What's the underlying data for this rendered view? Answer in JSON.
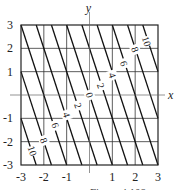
{
  "chart_data": {
    "type": "contour",
    "title": "",
    "xlabel": "x",
    "ylabel": "y",
    "xlim": [
      -3,
      3
    ],
    "ylim": [
      -3,
      3
    ],
    "grid": true,
    "xticks": [
      -3,
      -2,
      -1,
      1,
      2,
      3
    ],
    "yticks": [
      3,
      2,
      1,
      -1,
      -2,
      -3
    ],
    "xtick_labels": [
      "-3",
      "-2",
      "-1",
      "1",
      "2",
      "3"
    ],
    "ytick_labels": [
      "3",
      "2",
      "1",
      "-1",
      "-2",
      "-3"
    ],
    "function": "f(x,y) = |3x + y|",
    "contour_levels": [
      -12,
      -10,
      -8,
      -6,
      -4,
      -2,
      0,
      2,
      4,
      6,
      8,
      10,
      12
    ],
    "contour_labels": [
      {
        "text": "10",
        "x": 2.5,
        "y": 2.3
      },
      {
        "text": "8",
        "x": 2.0,
        "y": 1.95
      },
      {
        "text": "6",
        "x": 1.5,
        "y": 1.35
      },
      {
        "text": "4",
        "x": 1.0,
        "y": 0.85
      },
      {
        "text": "2",
        "x": 0.5,
        "y": 0.4
      },
      {
        "text": "0",
        "x": 0.0,
        "y": 0.0
      },
      {
        "text": "2",
        "x": -0.5,
        "y": -0.45
      },
      {
        "text": "4",
        "x": -1.0,
        "y": -0.85
      },
      {
        "text": "6",
        "x": -1.5,
        "y": -1.3
      },
      {
        "text": "8",
        "x": -2.0,
        "y": -1.95
      },
      {
        "text": "10",
        "x": -2.5,
        "y": -2.4
      }
    ]
  },
  "axes": {
    "x_label": "x",
    "y_label": "y"
  },
  "caption": "Figure 4.108"
}
